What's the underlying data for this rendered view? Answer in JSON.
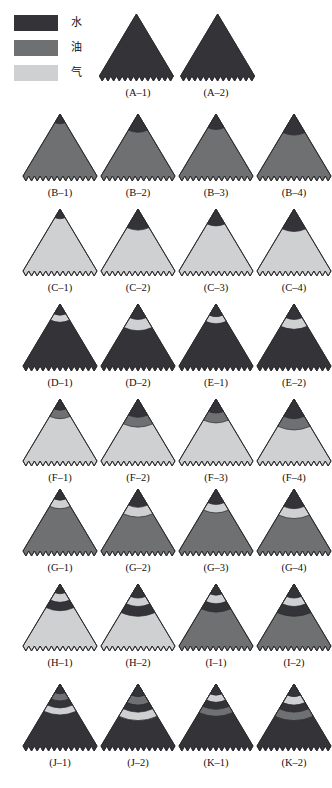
{
  "legend": {
    "items": [
      {
        "label": "水",
        "meaning": "water",
        "color": "#333338"
      },
      {
        "label": "油",
        "meaning": "oil",
        "color": "#6e7072"
      },
      {
        "label": "气",
        "meaning": "gas",
        "color": "#cfd0d1"
      }
    ]
  },
  "colors": {
    "water": "#333338",
    "oil": "#6e7072",
    "gas": "#cfd0d1",
    "outline": "#2a2a2e",
    "background": "#ffffff"
  },
  "chart_data": {
    "type": "diagram",
    "title": "",
    "legend": [
      "水",
      "油",
      "气"
    ],
    "columns": 4,
    "rows": 8,
    "panels": [
      {
        "label": "(A–1)",
        "row": 0,
        "col": 1,
        "fills": [
          "water"
        ]
      },
      {
        "label": "(A–2)",
        "row": 0,
        "col": 2,
        "fills": [
          "water"
        ]
      },
      {
        "label": "(B–1)",
        "row": 1,
        "col": 0,
        "fills": [
          "water",
          "oil"
        ]
      },
      {
        "label": "(B–2)",
        "row": 1,
        "col": 1,
        "fills": [
          "water",
          "oil"
        ]
      },
      {
        "label": "(B–3)",
        "row": 1,
        "col": 2,
        "fills": [
          "water",
          "oil"
        ]
      },
      {
        "label": "(B–4)",
        "row": 1,
        "col": 3,
        "fills": [
          "water",
          "oil"
        ]
      },
      {
        "label": "(C–1)",
        "row": 2,
        "col": 0,
        "fills": [
          "water",
          "gas"
        ]
      },
      {
        "label": "(C–2)",
        "row": 2,
        "col": 1,
        "fills": [
          "water",
          "gas"
        ]
      },
      {
        "label": "(C–3)",
        "row": 2,
        "col": 2,
        "fills": [
          "water",
          "gas"
        ]
      },
      {
        "label": "(C–4)",
        "row": 2,
        "col": 3,
        "fills": [
          "water",
          "gas"
        ]
      },
      {
        "label": "(D–1)",
        "row": 3,
        "col": 0,
        "fills": [
          "water",
          "gas",
          "water"
        ]
      },
      {
        "label": "(D–2)",
        "row": 3,
        "col": 1,
        "fills": [
          "water",
          "gas",
          "water"
        ]
      },
      {
        "label": "(E–1)",
        "row": 3,
        "col": 2,
        "fills": [
          "water",
          "gas",
          "water"
        ]
      },
      {
        "label": "(E–2)",
        "row": 3,
        "col": 3,
        "fills": [
          "water",
          "gas",
          "water"
        ]
      },
      {
        "label": "(F–1)",
        "row": 4,
        "col": 0,
        "fills": [
          "water",
          "oil",
          "gas"
        ]
      },
      {
        "label": "(F–2)",
        "row": 4,
        "col": 1,
        "fills": [
          "water",
          "oil",
          "gas"
        ]
      },
      {
        "label": "(F–3)",
        "row": 4,
        "col": 2,
        "fills": [
          "water",
          "oil",
          "gas"
        ]
      },
      {
        "label": "(F–4)",
        "row": 4,
        "col": 3,
        "fills": [
          "water",
          "oil",
          "gas"
        ]
      },
      {
        "label": "(G–1)",
        "row": 5,
        "col": 0,
        "fills": [
          "water",
          "gas",
          "oil"
        ]
      },
      {
        "label": "(G–2)",
        "row": 5,
        "col": 1,
        "fills": [
          "water",
          "gas",
          "oil"
        ]
      },
      {
        "label": "(G–3)",
        "row": 5,
        "col": 2,
        "fills": [
          "water",
          "gas",
          "oil"
        ]
      },
      {
        "label": "(G–4)",
        "row": 5,
        "col": 3,
        "fills": [
          "water",
          "gas",
          "oil"
        ]
      },
      {
        "label": "(H–1)",
        "row": 6,
        "col": 0,
        "fills": [
          "water",
          "gas",
          "water",
          "gas"
        ]
      },
      {
        "label": "(H–2)",
        "row": 6,
        "col": 1,
        "fills": [
          "water",
          "gas",
          "water",
          "gas"
        ]
      },
      {
        "label": "(I–1)",
        "row": 6,
        "col": 2,
        "fills": [
          "water",
          "gas",
          "water",
          "oil"
        ]
      },
      {
        "label": "(I–2)",
        "row": 6,
        "col": 3,
        "fills": [
          "water",
          "gas",
          "water",
          "oil"
        ]
      },
      {
        "label": "(J–1)",
        "row": 7,
        "col": 0,
        "fills": [
          "water",
          "oil",
          "water",
          "gas",
          "water"
        ]
      },
      {
        "label": "(J–2)",
        "row": 7,
        "col": 1,
        "fills": [
          "water",
          "oil",
          "water",
          "gas",
          "water"
        ]
      },
      {
        "label": "(K–1)",
        "row": 7,
        "col": 2,
        "fills": [
          "water",
          "gas",
          "water",
          "oil",
          "water"
        ]
      },
      {
        "label": "(K–2)",
        "row": 7,
        "col": 3,
        "fills": [
          "water",
          "gas",
          "water",
          "oil",
          "water"
        ]
      }
    ]
  },
  "layout": {
    "col_x": [
      20,
      98,
      176,
      254
    ],
    "row_y": [
      12,
      112,
      207,
      302,
      397,
      487,
      582,
      682
    ],
    "cell_w": 80,
    "tri_h": 74
  },
  "panel_geometry": {
    "A-1": {
      "apex_x": 0.48,
      "bands": []
    },
    "A-2": {
      "apex_x": 0.52,
      "bands": []
    },
    "B-1": {
      "apex_x": 0.5,
      "bands": [
        0.14
      ]
    },
    "B-2": {
      "apex_x": 0.5,
      "bands": [
        0.26
      ]
    },
    "B-3": {
      "apex_x": 0.5,
      "bands": [
        0.22
      ]
    },
    "B-4": {
      "apex_x": 0.5,
      "bands": [
        0.3
      ]
    },
    "C-1": {
      "apex_x": 0.5,
      "bands": [
        0.14
      ]
    },
    "C-2": {
      "apex_x": 0.5,
      "bands": [
        0.3
      ]
    },
    "C-3": {
      "apex_x": 0.5,
      "bands": [
        0.24
      ]
    },
    "C-4": {
      "apex_x": 0.5,
      "bands": [
        0.32
      ]
    },
    "D-1": {
      "apex_x": 0.5,
      "bands": [
        0.16,
        0.26
      ]
    },
    "D-2": {
      "apex_x": 0.5,
      "bands": [
        0.22,
        0.38
      ]
    },
    "E-1": {
      "apex_x": 0.5,
      "bands": [
        0.18,
        0.28
      ]
    },
    "E-2": {
      "apex_x": 0.5,
      "bands": [
        0.22,
        0.36
      ]
    },
    "F-1": {
      "apex_x": 0.5,
      "bands": [
        0.16,
        0.28
      ]
    },
    "F-2": {
      "apex_x": 0.5,
      "bands": [
        0.26,
        0.4
      ]
    },
    "F-3": {
      "apex_x": 0.5,
      "bands": [
        0.2,
        0.34
      ]
    },
    "F-4": {
      "apex_x": 0.5,
      "bands": [
        0.28,
        0.44
      ]
    },
    "G-1": {
      "apex_x": 0.5,
      "bands": [
        0.16,
        0.28
      ]
    },
    "G-2": {
      "apex_x": 0.5,
      "bands": [
        0.26,
        0.4
      ]
    },
    "G-3": {
      "apex_x": 0.5,
      "bands": [
        0.22,
        0.34
      ]
    },
    "G-4": {
      "apex_x": 0.5,
      "bands": [
        0.28,
        0.42
      ]
    },
    "H-1": {
      "apex_x": 0.5,
      "bands": [
        0.14,
        0.26,
        0.38
      ]
    },
    "H-2": {
      "apex_x": 0.5,
      "bands": [
        0.2,
        0.32,
        0.46
      ]
    },
    "I-1": {
      "apex_x": 0.5,
      "bands": [
        0.16,
        0.28,
        0.4
      ]
    },
    "I-2": {
      "apex_x": 0.5,
      "bands": [
        0.2,
        0.32,
        0.46
      ]
    },
    "J-1": {
      "apex_x": 0.5,
      "bands": [
        0.14,
        0.24,
        0.34,
        0.44
      ]
    },
    "J-2": {
      "apex_x": 0.5,
      "bands": [
        0.18,
        0.3,
        0.4,
        0.52
      ]
    },
    "K-1": {
      "apex_x": 0.5,
      "bands": [
        0.16,
        0.26,
        0.36,
        0.46
      ]
    },
    "K-2": {
      "apex_x": 0.5,
      "bands": [
        0.18,
        0.3,
        0.4,
        0.52
      ]
    }
  }
}
